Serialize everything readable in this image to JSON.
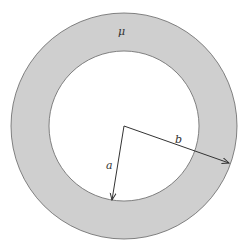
{
  "diagram": {
    "type": "annulus",
    "center": [
      124,
      126
    ],
    "outer_radius": 113,
    "inner_radius": 75,
    "fill_color": "#cfcfcf",
    "stroke_color": "#555555",
    "labels": {
      "material": "μ",
      "inner_radius": "a",
      "outer_radius": "b"
    },
    "arrows": [
      {
        "name": "a",
        "from": [
          124,
          126
        ],
        "to": [
          112,
          200
        ]
      },
      {
        "name": "b",
        "from": [
          124,
          126
        ],
        "to": [
          229,
          163
        ]
      }
    ]
  }
}
